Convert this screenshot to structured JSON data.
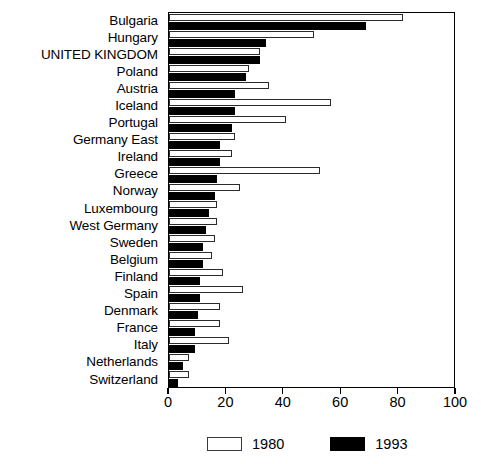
{
  "chart_data": {
    "type": "bar",
    "orientation": "horizontal",
    "title": "",
    "subtitle": "",
    "xlabel": "",
    "ylabel": "",
    "xlim": [
      0,
      100
    ],
    "xticks": [
      "0",
      "20",
      "40",
      "60",
      "80",
      "100"
    ],
    "grid": false,
    "legend_position": "bottom",
    "categories": [
      "Bulgaria",
      "Hungary",
      "UNITED KINGDOM",
      "Poland",
      "Austria",
      "Iceland",
      "Portugal",
      "Germany East",
      "Ireland",
      "Greece",
      "Norway",
      "Luxembourg",
      "West Germany",
      "Sweden",
      "Belgium",
      "Finland",
      "Spain",
      "Denmark",
      "France",
      "Italy",
      "Netherlands",
      "Switzerland"
    ],
    "series": [
      {
        "name": "1980",
        "color": "#ffffff",
        "values": [
          82,
          51,
          32,
          28,
          35,
          57,
          41,
          23,
          22,
          53,
          25,
          17,
          17,
          16,
          15,
          19,
          26,
          18,
          18,
          21,
          7,
          7
        ]
      },
      {
        "name": "1993",
        "color": "#000000",
        "values": [
          69,
          34,
          32,
          27,
          23,
          23,
          22,
          18,
          18,
          17,
          16,
          14,
          13,
          12,
          12,
          11,
          11,
          10,
          9,
          9,
          5,
          3
        ]
      }
    ]
  },
  "legend": {
    "entries": [
      {
        "label": "1980",
        "swatch": "white-open-square"
      },
      {
        "label": "1993",
        "swatch": "black-filled-square"
      }
    ]
  }
}
